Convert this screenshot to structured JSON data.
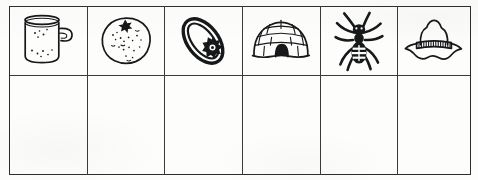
{
  "worksheet": {
    "title": "Picture grid worksheet",
    "description": "Row of six line-drawing picture cells above an empty answer row",
    "rows": 2,
    "columns": 6,
    "ink_color": "#17181a",
    "grid_line_color": "#3a3a3a",
    "paper_color": "#fdfdfc"
  },
  "picture_row": {
    "label": "Picture row",
    "cells": [
      {
        "index": 1,
        "icon": "mug-icon",
        "label": "mug",
        "initial_letter": "m"
      },
      {
        "index": 2,
        "icon": "orange-fruit-icon",
        "label": "orange",
        "initial_letter": "o"
      },
      {
        "index": 3,
        "icon": "ring-icon",
        "label": "ring",
        "initial_letter": "r"
      },
      {
        "index": 4,
        "icon": "igloo-icon",
        "label": "igloo",
        "initial_letter": "i"
      },
      {
        "index": 5,
        "icon": "ant-insect-icon",
        "label": "ant",
        "initial_letter": "a"
      },
      {
        "index": 6,
        "icon": "hat-icon",
        "label": "hat",
        "initial_letter": "h"
      }
    ]
  },
  "answer_row": {
    "label": "Answer row",
    "cells": [
      {
        "index": 1,
        "value": ""
      },
      {
        "index": 2,
        "value": ""
      },
      {
        "index": 3,
        "value": ""
      },
      {
        "index": 4,
        "value": ""
      },
      {
        "index": 5,
        "value": ""
      },
      {
        "index": 6,
        "value": ""
      }
    ]
  }
}
